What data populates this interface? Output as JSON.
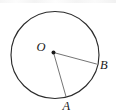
{
  "figure": {
    "type": "circle-with-two-radii",
    "background_color": "#ffffff",
    "stroke_color": "#2b2b2b",
    "radius_stroke_color": "#6d6d6d",
    "label_color": "#1a1a1a",
    "canvas": {
      "width": 116,
      "height": 112
    }
  },
  "circle": {
    "center_x": 55,
    "center_y": 55,
    "radius": 44
  },
  "center_point": {
    "label": "O",
    "x": 53.5,
    "y": 52.5,
    "dot_radius": 2.0,
    "label_x": 36.5,
    "label_y": 50.5
  },
  "points": [
    {
      "label": "B",
      "x": 96.5,
      "y": 64.0,
      "label_x": 100.0,
      "label_y": 68.5
    },
    {
      "label": "A",
      "x": 66.0,
      "y": 96.5,
      "label_x": 62.5,
      "label_y": 110.0
    }
  ],
  "radii": [
    {
      "name": "radius-OB",
      "from": "O",
      "to": "B"
    },
    {
      "name": "radius-OA",
      "from": "O",
      "to": "A"
    }
  ]
}
